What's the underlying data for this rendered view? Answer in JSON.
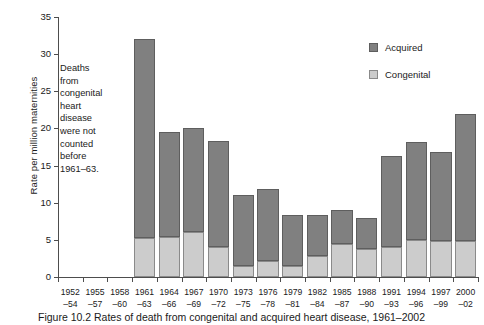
{
  "chart_data": {
    "type": "bar",
    "subtype": "stacked-bar",
    "title": "",
    "xlabel": "",
    "ylabel": "Rate per million maternities",
    "ylim": [
      0,
      35
    ],
    "yticks": [
      0,
      5,
      10,
      15,
      20,
      25,
      30,
      35
    ],
    "grid": false,
    "categories": [
      "1952–54",
      "1955–57",
      "1958–60",
      "1961–63",
      "1964–66",
      "1967–69",
      "1970–72",
      "1973–75",
      "1976–78",
      "1979–81",
      "1982–84",
      "1985–87",
      "1988–90",
      "1991–93",
      "1994–96",
      "1997–99",
      "2000–02"
    ],
    "category_lines": [
      [
        "1952",
        "–54"
      ],
      [
        "1955",
        "–57"
      ],
      [
        "1958",
        "–60"
      ],
      [
        "1961",
        "–63"
      ],
      [
        "1964",
        "–66"
      ],
      [
        "1967",
        "–69"
      ],
      [
        "1970",
        "–72"
      ],
      [
        "1973",
        "–75"
      ],
      [
        "1976",
        "–78"
      ],
      [
        "1979",
        "–81"
      ],
      [
        "1982",
        "–84"
      ],
      [
        "1985",
        "–87"
      ],
      [
        "1988",
        "–90"
      ],
      [
        "1991",
        "–93"
      ],
      [
        "1994",
        "–96"
      ],
      [
        "1997",
        "–99"
      ],
      [
        "2000",
        "–02"
      ]
    ],
    "series": [
      {
        "name": "Congenital",
        "color": "#cccccc",
        "values": [
          0,
          0,
          0,
          5.2,
          5.4,
          6.1,
          4.0,
          1.5,
          2.2,
          1.5,
          2.8,
          4.4,
          3.8,
          4.1,
          5.0,
          4.8,
          4.8
        ]
      },
      {
        "name": "Acquired",
        "color": "#808080",
        "values": [
          0,
          0,
          0,
          26.8,
          14.1,
          14.0,
          14.3,
          9.6,
          9.7,
          6.9,
          5.5,
          4.6,
          4.2,
          12.2,
          13.2,
          12.0,
          17.2
        ]
      }
    ],
    "totals": [
      0,
      0,
      0,
      32.0,
      19.5,
      20.1,
      18.3,
      11.1,
      11.9,
      8.4,
      8.3,
      9.0,
      8.0,
      16.3,
      18.2,
      16.8,
      22.0
    ],
    "legend": {
      "position": "top-right",
      "entries": [
        {
          "label": "Acquired",
          "color": "#808080"
        },
        {
          "label": "Congenital",
          "color": "#cccccc"
        }
      ]
    },
    "annotation": {
      "lines": [
        "Deaths",
        "from",
        "congenital",
        "heart",
        "disease",
        "were not",
        "counted",
        "before",
        "1961–63."
      ]
    }
  },
  "legend": {
    "acquired_label": "Acquired",
    "congenital_label": "Congenital"
  },
  "axis": {
    "y_title": "Rate per million maternities",
    "y_tick_labels": [
      "35",
      "30",
      "25",
      "20",
      "15",
      "10",
      "5",
      "0"
    ]
  },
  "annotation": {
    "line1": "Deaths",
    "line2": "from",
    "line3": "congenital",
    "line4": "heart",
    "line5": "disease",
    "line6": "were not",
    "line7": "counted",
    "line8": "before",
    "line9": "1961–63."
  },
  "caption": {
    "text": "Figure 10.2 Rates of death from congenital and acquired heart disease, 1961–2002"
  },
  "colors": {
    "acquired": "#808080",
    "congenital": "#cccccc",
    "axis": "#4d4d4d",
    "text": "#1a1a1a",
    "background": "#ffffff"
  }
}
